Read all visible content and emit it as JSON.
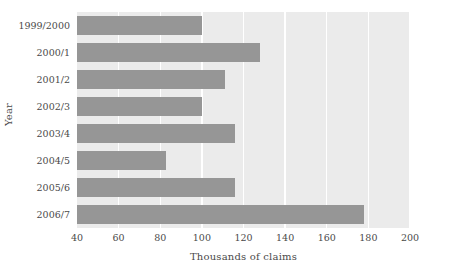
{
  "chart_data": {
    "type": "bar",
    "orientation": "horizontal",
    "title": "",
    "xlabel": "Thousands of claims",
    "ylabel": "Year",
    "categories": [
      "1999/2000",
      "2000/1",
      "2001/2",
      "2002/3",
      "2003/4",
      "2004/5",
      "2005/6",
      "2006/7"
    ],
    "values": [
      100,
      128,
      111,
      100,
      116,
      83,
      116,
      178
    ],
    "xlim": [
      40,
      200
    ],
    "xticks": [
      40,
      60,
      80,
      100,
      120,
      140,
      160,
      180,
      200
    ],
    "xtick_labels": [
      "40",
      "60",
      "80",
      "100",
      "120",
      "140",
      "160",
      "180",
      "200"
    ],
    "grid": "vertical-white-on-gray",
    "legend": null,
    "colors": {
      "bar": "#969696",
      "plot_background": "#ebebeb",
      "gridline": "#ffffff",
      "figure_background": "#ffffff",
      "text": "#4a4a4a"
    }
  }
}
